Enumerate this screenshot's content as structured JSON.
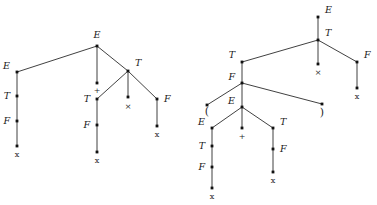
{
  "figure": {
    "kind": "parse-trees",
    "background_color": "#ffffff",
    "edge_color": "#2b2b2b",
    "node_color": "#111111",
    "text_color": "#1a1a1a"
  },
  "trees": [
    {
      "id": "left-tree",
      "name": "parse-tree-x-plus-x-times-x",
      "nodes": [
        {
          "id": "L0",
          "label": "E",
          "kind": "nonterminal",
          "x": 97,
          "y": 46,
          "label_x": 97,
          "label_y": 38,
          "label_anchor": "middle"
        },
        {
          "id": "L1",
          "label": "E",
          "kind": "nonterminal",
          "x": 17,
          "y": 72,
          "label_x": 10,
          "label_y": 69,
          "label_anchor": "end"
        },
        {
          "id": "L2",
          "label": "+",
          "kind": "terminal",
          "x": 97,
          "y": 83,
          "label_x": 97,
          "label_y": 93,
          "label_anchor": "middle"
        },
        {
          "id": "L3",
          "label": "T",
          "kind": "nonterminal",
          "x": 128,
          "y": 71,
          "label_x": 135,
          "label_y": 66,
          "label_anchor": "start"
        },
        {
          "id": "L4",
          "label": "T",
          "kind": "nonterminal",
          "x": 17,
          "y": 96,
          "label_x": 10,
          "label_y": 99,
          "label_anchor": "end"
        },
        {
          "id": "L5",
          "label": "F",
          "kind": "nonterminal",
          "x": 17,
          "y": 121,
          "label_x": 10,
          "label_y": 124,
          "label_anchor": "end"
        },
        {
          "id": "L6",
          "label": "x",
          "kind": "terminal",
          "x": 17,
          "y": 146,
          "label_x": 17,
          "label_y": 157,
          "label_anchor": "middle"
        },
        {
          "id": "L7",
          "label": "T",
          "kind": "nonterminal",
          "x": 97,
          "y": 99,
          "label_x": 90,
          "label_y": 102,
          "label_anchor": "end"
        },
        {
          "id": "L8",
          "label": "×",
          "kind": "terminal",
          "x": 128,
          "y": 97,
          "label_x": 128,
          "label_y": 109,
          "label_anchor": "middle"
        },
        {
          "id": "L9",
          "label": "F",
          "kind": "nonterminal",
          "x": 157,
          "y": 99,
          "label_x": 164,
          "label_y": 102,
          "label_anchor": "start"
        },
        {
          "id": "L10",
          "label": "F",
          "kind": "nonterminal",
          "x": 97,
          "y": 125,
          "label_x": 90,
          "label_y": 128,
          "label_anchor": "end"
        },
        {
          "id": "L11",
          "label": "x",
          "kind": "terminal",
          "x": 97,
          "y": 152,
          "label_x": 97,
          "label_y": 163,
          "label_anchor": "middle"
        },
        {
          "id": "L12",
          "label": "x",
          "kind": "terminal",
          "x": 157,
          "y": 126,
          "label_x": 157,
          "label_y": 137,
          "label_anchor": "middle"
        }
      ],
      "edges": [
        [
          "L0",
          "L1"
        ],
        [
          "L0",
          "L2"
        ],
        [
          "L0",
          "L3"
        ],
        [
          "L1",
          "L4"
        ],
        [
          "L4",
          "L5"
        ],
        [
          "L5",
          "L6"
        ],
        [
          "L3",
          "L7"
        ],
        [
          "L3",
          "L8"
        ],
        [
          "L3",
          "L9"
        ],
        [
          "L7",
          "L10"
        ],
        [
          "L10",
          "L11"
        ],
        [
          "L9",
          "L12"
        ]
      ]
    },
    {
      "id": "right-tree",
      "name": "parse-tree-paren-x-plus-x-times-x",
      "nodes": [
        {
          "id": "R0",
          "label": "E",
          "kind": "nonterminal",
          "x": 318,
          "y": 17,
          "label_x": 325,
          "label_y": 13,
          "label_anchor": "start"
        },
        {
          "id": "R1",
          "label": "T",
          "kind": "nonterminal",
          "x": 318,
          "y": 40,
          "label_x": 325,
          "label_y": 36,
          "label_anchor": "start"
        },
        {
          "id": "R2",
          "label": "T",
          "kind": "nonterminal",
          "x": 242,
          "y": 62,
          "label_x": 235,
          "label_y": 58,
          "label_anchor": "end"
        },
        {
          "id": "R3",
          "label": "×",
          "kind": "terminal",
          "x": 318,
          "y": 64,
          "label_x": 318,
          "label_y": 75,
          "label_anchor": "middle"
        },
        {
          "id": "R4",
          "label": "F",
          "kind": "nonterminal",
          "x": 357,
          "y": 62,
          "label_x": 364,
          "label_y": 58,
          "label_anchor": "start"
        },
        {
          "id": "R5",
          "label": "x",
          "kind": "terminal",
          "x": 357,
          "y": 88,
          "label_x": 357,
          "label_y": 99,
          "label_anchor": "middle"
        },
        {
          "id": "R6",
          "label": "F",
          "kind": "nonterminal",
          "x": 242,
          "y": 83,
          "label_x": 235,
          "label_y": 80,
          "label_anchor": "end"
        },
        {
          "id": "R7",
          "label": "(",
          "kind": "terminal",
          "x": 207,
          "y": 105,
          "label_x": 207,
          "label_y": 115,
          "label_anchor": "middle"
        },
        {
          "id": "R8",
          "label": "E",
          "kind": "nonterminal",
          "x": 242,
          "y": 107,
          "label_x": 235,
          "label_y": 104,
          "label_anchor": "end"
        },
        {
          "id": "R9",
          "label": ")",
          "kind": "terminal",
          "x": 322,
          "y": 104,
          "label_x": 322,
          "label_y": 116,
          "label_anchor": "middle"
        },
        {
          "id": "R10",
          "label": "E",
          "kind": "nonterminal",
          "x": 212,
          "y": 128,
          "label_x": 205,
          "label_y": 125,
          "label_anchor": "end"
        },
        {
          "id": "R11",
          "label": "+",
          "kind": "terminal",
          "x": 242,
          "y": 128,
          "label_x": 242,
          "label_y": 139,
          "label_anchor": "middle"
        },
        {
          "id": "R12",
          "label": "T",
          "kind": "nonterminal",
          "x": 273,
          "y": 128,
          "label_x": 280,
          "label_y": 125,
          "label_anchor": "start"
        },
        {
          "id": "R13",
          "label": "T",
          "kind": "nonterminal",
          "x": 212,
          "y": 146,
          "label_x": 205,
          "label_y": 149,
          "label_anchor": "end"
        },
        {
          "id": "R14",
          "label": "F",
          "kind": "nonterminal",
          "x": 212,
          "y": 167,
          "label_x": 205,
          "label_y": 170,
          "label_anchor": "end"
        },
        {
          "id": "R15",
          "label": "x",
          "kind": "terminal",
          "x": 212,
          "y": 188,
          "label_x": 212,
          "label_y": 199,
          "label_anchor": "middle"
        },
        {
          "id": "R16",
          "label": "F",
          "kind": "nonterminal",
          "x": 273,
          "y": 149,
          "label_x": 280,
          "label_y": 152,
          "label_anchor": "start"
        },
        {
          "id": "R17",
          "label": "x",
          "kind": "terminal",
          "x": 273,
          "y": 172,
          "label_x": 273,
          "label_y": 183,
          "label_anchor": "middle"
        }
      ],
      "edges": [
        [
          "R0",
          "R1"
        ],
        [
          "R1",
          "R2"
        ],
        [
          "R1",
          "R3"
        ],
        [
          "R1",
          "R4"
        ],
        [
          "R4",
          "R5"
        ],
        [
          "R2",
          "R6"
        ],
        [
          "R6",
          "R7"
        ],
        [
          "R6",
          "R8"
        ],
        [
          "R6",
          "R9"
        ],
        [
          "R8",
          "R10"
        ],
        [
          "R8",
          "R11"
        ],
        [
          "R8",
          "R12"
        ],
        [
          "R10",
          "R13"
        ],
        [
          "R13",
          "R14"
        ],
        [
          "R14",
          "R15"
        ],
        [
          "R12",
          "R16"
        ],
        [
          "R16",
          "R17"
        ]
      ]
    }
  ]
}
